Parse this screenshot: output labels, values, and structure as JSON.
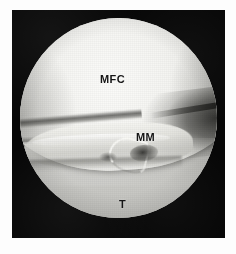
{
  "figure": {
    "type": "arthroscopic-photograph",
    "modality": "knee arthroscopy",
    "view_shape": "circular endoscopic field of view",
    "background_color": "#070707",
    "paper_color": "#fdfdfd",
    "annotation_color": "#151515"
  },
  "annotations": [
    {
      "id": "mfc",
      "label": "MFC",
      "meaning": "medial femoral condyle",
      "x": 88,
      "y": 64
    },
    {
      "id": "mm",
      "label": "MM",
      "meaning": "medial meniscus",
      "x": 124,
      "y": 122
    },
    {
      "id": "t",
      "label": "T",
      "meaning": "tibia / tibial plateau",
      "x": 107,
      "y": 189
    }
  ],
  "structures": {
    "femoral_condyle": "bright convex cartilage dome occupying the upper half of the field",
    "meniscus": "pale wedge with a bright free edge crossing the middle of the field",
    "meniscal_tear": "hook-shaped torn flap with an adjacent dark defect at the centre",
    "tibial_plateau": "broad mid-grey surface filling the lower field",
    "posterior_recess": "dark crevice opening toward the right rim"
  }
}
